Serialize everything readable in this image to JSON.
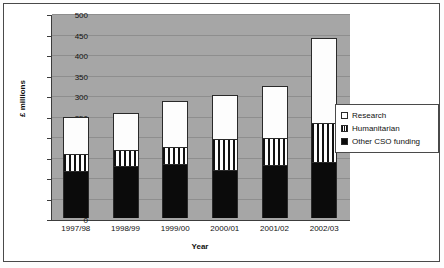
{
  "chart_data": {
    "type": "bar",
    "subtype": "stacked",
    "title": "",
    "xlabel": "Year",
    "ylabel": "£ millions",
    "ylim": [
      0,
      500
    ],
    "ytick_step": 50,
    "yticks": [
      0,
      50,
      100,
      150,
      200,
      250,
      300,
      350,
      400,
      450,
      500
    ],
    "categories": [
      "1997/98",
      "1998/99",
      "1999/00",
      "2000/01",
      "2001/02",
      "2002/03"
    ],
    "grid": true,
    "grid_axis": "y",
    "legend_position": "right",
    "plot_background": "#a6a6a6",
    "series": [
      {
        "name": "Other CSO funding",
        "color": "#0b0b0b",
        "pattern": "solid",
        "values": [
          115,
          126,
          132,
          116,
          130,
          136
        ]
      },
      {
        "name": "Humanitarian",
        "color": "#ffffff",
        "pattern": "vertical-stripes",
        "values": [
          42,
          39,
          42,
          77,
          66,
          95
        ]
      },
      {
        "name": "Research",
        "color": "#ffffff",
        "pattern": "solid",
        "values": [
          89,
          92,
          112,
          107,
          127,
          209
        ]
      }
    ],
    "cumulative_tops": {
      "other_cso": [
        115,
        126,
        132,
        116,
        130,
        136
      ],
      "humanitarian": [
        157,
        165,
        174,
        193,
        196,
        231
      ],
      "total": [
        246,
        257,
        286,
        300,
        323,
        440
      ]
    },
    "legend_entries": [
      {
        "label": "Research",
        "swatch": "white-square"
      },
      {
        "label": "Humanitarian",
        "swatch": "striped-square"
      },
      {
        "label": "Other CSO funding",
        "swatch": "black-square"
      }
    ]
  }
}
